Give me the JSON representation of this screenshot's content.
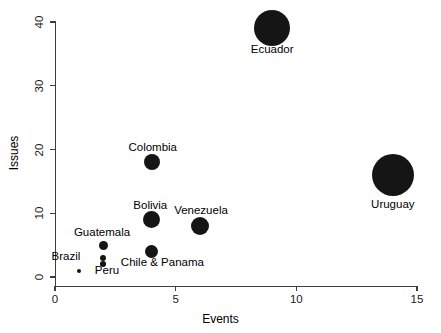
{
  "chart_data": {
    "type": "scatter",
    "title": "",
    "xlabel": "Events",
    "ylabel": "Issues",
    "xlim": [
      0,
      15.2
    ],
    "ylim": [
      0,
      41.5
    ],
    "xticks": [
      0,
      5,
      10,
      15
    ],
    "xtick_labels": [
      "0",
      "5",
      "10",
      "15"
    ],
    "yticks": [
      0,
      10,
      20,
      30,
      40
    ],
    "ytick_labels": [
      "0",
      "10",
      "20",
      "30",
      "40"
    ],
    "grid": false,
    "legend": "none",
    "marker_color": "#151515",
    "size_encoding": "bubble area proportional to magnitude",
    "points": [
      {
        "label": "Ecuador",
        "x": 9,
        "y": 39,
        "r": 18.0
      },
      {
        "label": "Uruguay",
        "x": 14,
        "y": 16,
        "r": 21.0
      },
      {
        "label": "Colombia",
        "x": 4,
        "y": 18,
        "r": 8.0
      },
      {
        "label": "Bolivia",
        "x": 4,
        "y": 9,
        "r": 8.5
      },
      {
        "label": "Venezuela",
        "x": 6,
        "y": 8,
        "r": 9.0
      },
      {
        "label": "Chile & Panama",
        "x": 4,
        "y": 4,
        "r": 6.5
      },
      {
        "label": "Guatemala",
        "x": 2,
        "y": 5,
        "r": 4.5
      },
      {
        "label": "Brazil",
        "x": 2,
        "y": 3,
        "r": 3.2
      },
      {
        "label": "",
        "x": 2,
        "y": 2,
        "r": 2.8
      },
      {
        "label": "Peru",
        "x": 1,
        "y": 1,
        "r": 2.0
      }
    ],
    "point_labels": [
      {
        "text": "Ecuador",
        "x": 9.0,
        "y": 35.6,
        "anchor": "center"
      },
      {
        "text": "Uruguay",
        "x": 14.0,
        "y": 11.3,
        "anchor": "center"
      },
      {
        "text": "Colombia",
        "x": 4.05,
        "y": 20.2,
        "anchor": "center"
      },
      {
        "text": "Bolivia",
        "x": 3.95,
        "y": 11.2,
        "anchor": "center"
      },
      {
        "text": "Venezuela",
        "x": 6.05,
        "y": 10.4,
        "anchor": "center"
      },
      {
        "text": "Chile & Panama",
        "x": 4.45,
        "y": 2.2,
        "anchor": "center"
      },
      {
        "text": "Guatemala",
        "x": 1.95,
        "y": 6.9,
        "anchor": "center"
      },
      {
        "text": "Brazil",
        "x": 1.05,
        "y": 3.1,
        "anchor": "right"
      },
      {
        "text": "Peru",
        "x": 1.65,
        "y": 0.9,
        "anchor": "left"
      }
    ]
  }
}
